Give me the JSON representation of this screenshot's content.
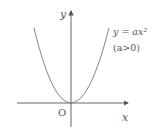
{
  "diagram": {
    "type": "parabola-graph",
    "axes": {
      "x_label": "x",
      "y_label": "y",
      "origin_label": "O"
    },
    "curve": {
      "equation_line1": "y = ax²",
      "equation_line2": "(a>0)"
    },
    "colors": {
      "axis": "#555555",
      "curve": "#777777",
      "text": "#555555"
    }
  }
}
